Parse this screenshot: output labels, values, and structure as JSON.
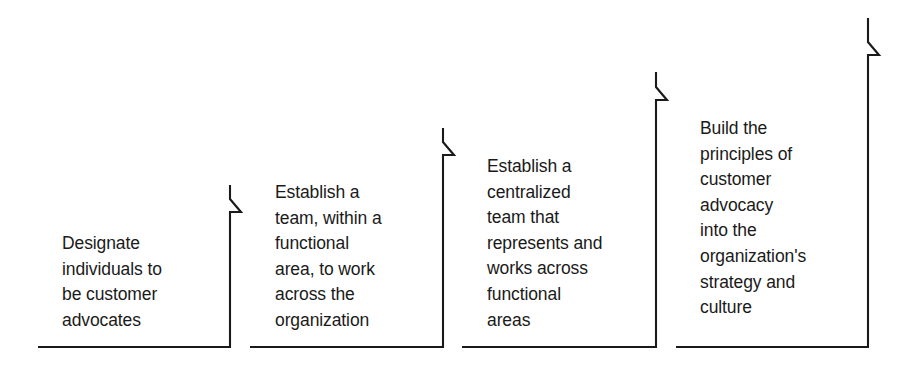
{
  "diagram": {
    "type": "staircase-progression",
    "title": "",
    "orientation": "ascending-left-to-right",
    "stroke_color": "#1a1a1a",
    "background_color": "#ffffff",
    "baseline_y": 347,
    "steps": [
      {
        "index": 1,
        "text": "Designate\nindividuals to\nbe customer\nadvocates",
        "lines": [
          "Designate",
          "individuals to",
          "be customer",
          "advocates"
        ],
        "bottom_line_start_x": 38,
        "bottom_line_end_x": 230,
        "riser_x": 230,
        "riser_top_y": 185,
        "chevron_apex_y": 212,
        "chevron_apex_x": 241
      },
      {
        "index": 2,
        "text": "Establish a\nteam, within a\nfunctional\narea, to work\nacross the\norganization",
        "lines": [
          "Establish a",
          "team, within a",
          "functional",
          "area, to work",
          "across the",
          "organization"
        ],
        "bottom_line_start_x": 250,
        "bottom_line_end_x": 443,
        "riser_x": 443,
        "riser_top_y": 128,
        "chevron_apex_y": 155,
        "chevron_apex_x": 454
      },
      {
        "index": 3,
        "text": "Establish a\ncentralized\nteam that\nrepresents and\nworks across\nfunctional\nareas",
        "lines": [
          "Establish a",
          "centralized",
          "team that",
          "represents and",
          "works across",
          "functional",
          "areas"
        ],
        "bottom_line_start_x": 462,
        "bottom_line_end_x": 656,
        "riser_x": 656,
        "riser_top_y": 72,
        "chevron_apex_y": 100,
        "chevron_apex_x": 667
      },
      {
        "index": 4,
        "text": "Build the\nprinciples of\ncustomer\nadvocacy\ninto the\norganization's\nstrategy and\nculture",
        "lines": [
          "Build the",
          "principles of",
          "customer",
          "advocacy",
          "into the",
          "organization's",
          "strategy and",
          "culture"
        ],
        "bottom_line_start_x": 676,
        "bottom_line_end_x": 868,
        "riser_x": 868,
        "riser_top_y": 18,
        "chevron_apex_y": 55,
        "chevron_apex_x": 879
      }
    ]
  }
}
